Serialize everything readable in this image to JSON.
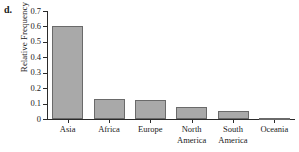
{
  "panel": {
    "label": "d."
  },
  "chart_data": {
    "type": "bar",
    "title": "",
    "subtitle": "",
    "xlabel": "",
    "ylabel": "Relative Frequency",
    "categories": [
      "Asia",
      "Africa",
      "Europe",
      "North\nAmerica",
      "South\nAmerica",
      "Oceania"
    ],
    "values": [
      0.605,
      0.13,
      0.12,
      0.08,
      0.055,
      0.005
    ],
    "ylim": [
      0,
      0.7
    ],
    "ytick_values": [
      0,
      0.1,
      0.2,
      0.3,
      0.4,
      0.5,
      0.6,
      0.7
    ],
    "ytick_labels": [
      "0",
      "0.1",
      "0.2",
      "0.3",
      "0.4",
      "0.5",
      "0.6",
      "0.7"
    ],
    "grid": false,
    "legend": false,
    "bar_fill_color": "#a9a9a9",
    "bar_border_color": "#6a6a6a",
    "axis_color": "#2b2b2b"
  }
}
